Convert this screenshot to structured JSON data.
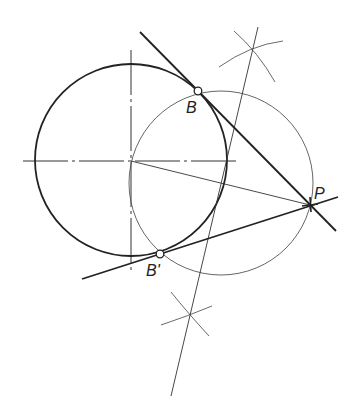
{
  "diagram": {
    "type": "geometric-construction",
    "labels": {
      "point_b": "B",
      "point_b_prime": "B'",
      "point_p": "P"
    },
    "geometry": {
      "main_circle": {
        "cx": 131,
        "cy": 160,
        "r": 96
      },
      "thales_circle": {
        "cx": 221,
        "cy": 183,
        "r": 92
      },
      "P": [
        310,
        205
      ],
      "B": [
        198,
        91
      ],
      "B_prime": [
        160,
        254
      ],
      "arc_intersection_top": [
        253,
        49
      ],
      "arc_intersection_bottom": [
        189,
        317
      ]
    },
    "colors": {
      "ink": "#222222",
      "thin": "#555555",
      "background": "#ffffff"
    }
  }
}
